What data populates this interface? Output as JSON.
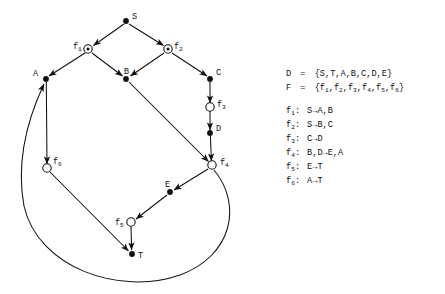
{
  "figure": {
    "kind": "petri-net-style-directed-graph",
    "ink_color": "#111111",
    "background": "#ffffff"
  },
  "graph": {
    "place_nodes": [
      {
        "id": "S",
        "label": "S",
        "x": 126,
        "y": 21,
        "label_dx": 6,
        "label_dy": -8
      },
      {
        "id": "A",
        "label": "A",
        "x": 46,
        "y": 79,
        "label_dx": -13,
        "label_dy": -9
      },
      {
        "id": "B",
        "label": "B",
        "x": 126,
        "y": 79,
        "label_dx": -2,
        "label_dy": -11
      },
      {
        "id": "C",
        "label": "C",
        "x": 210,
        "y": 79,
        "label_dx": 6,
        "label_dy": -10
      },
      {
        "id": "D",
        "label": "D",
        "x": 210,
        "y": 133,
        "label_dx": 6,
        "label_dy": -8
      },
      {
        "id": "E",
        "label": "E",
        "x": 170,
        "y": 192,
        "label_dx": -5,
        "label_dy": -11
      },
      {
        "id": "T",
        "label": "T",
        "x": 132,
        "y": 254,
        "label_dx": 6,
        "label_dy": -2
      }
    ],
    "transition_nodes": [
      {
        "id": "f1",
        "base": "f",
        "sub": "1",
        "x": 88,
        "y": 49,
        "label_dx": -15,
        "label_dy": -6
      },
      {
        "id": "f2",
        "base": "f",
        "sub": "2",
        "x": 168,
        "y": 49,
        "label_dx": 6,
        "label_dy": -6
      },
      {
        "id": "f3",
        "base": "f",
        "sub": "3",
        "x": 210,
        "y": 107,
        "label_dx": 7,
        "label_dy": -6
      },
      {
        "id": "f4",
        "base": "f",
        "sub": "4",
        "x": 212,
        "y": 165,
        "label_dx": 8,
        "label_dy": -6
      },
      {
        "id": "f5",
        "base": "f",
        "sub": "5",
        "x": 131,
        "y": 222,
        "label_dx": -16,
        "label_dy": -3
      },
      {
        "id": "f6",
        "base": "f",
        "sub": "6",
        "x": 47,
        "y": 168,
        "label_dx": 6,
        "label_dy": -10
      }
    ],
    "edges": [
      {
        "from": "S",
        "to": "f1",
        "shape": "line"
      },
      {
        "from": "S",
        "to": "f2",
        "shape": "line"
      },
      {
        "from": "f1",
        "to": "A",
        "shape": "line"
      },
      {
        "from": "f1",
        "to": "B",
        "shape": "line"
      },
      {
        "from": "f2",
        "to": "B",
        "shape": "line"
      },
      {
        "from": "f2",
        "to": "C",
        "shape": "line"
      },
      {
        "from": "C",
        "to": "f3",
        "shape": "line"
      },
      {
        "from": "f3",
        "to": "D",
        "shape": "line"
      },
      {
        "from": "D",
        "to": "f4",
        "shape": "line"
      },
      {
        "from": "B",
        "to": "f4",
        "shape": "line"
      },
      {
        "from": "f4",
        "to": "E",
        "shape": "line"
      },
      {
        "from": "E",
        "to": "f5",
        "shape": "line"
      },
      {
        "from": "f5",
        "to": "T",
        "shape": "line"
      },
      {
        "from": "A",
        "to": "f6",
        "shape": "line"
      },
      {
        "from": "f6",
        "to": "T",
        "shape": "line"
      },
      {
        "from": "f4",
        "to": "A",
        "shape": "curve"
      }
    ]
  },
  "legend": {
    "set_lines": [
      {
        "name": "D-set",
        "lhs": "D",
        "eq": "=",
        "rhs": "{S,T,A,B,C,D,E}"
      },
      {
        "name": "F-set",
        "lhs": "F",
        "eq": "=",
        "rhs_parts": [
          "{f",
          "1",
          ",f",
          "2",
          ",f",
          "3",
          ",f",
          "4",
          ",f",
          "5",
          ",f",
          "6",
          "}"
        ],
        "rhs_plain": "{f1,f2,f3,f4,f5,f6}"
      }
    ],
    "rules": [
      {
        "name": "f1",
        "base": "f",
        "sub": "1",
        "colon": ":",
        "body": "S→A,B"
      },
      {
        "name": "f2",
        "base": "f",
        "sub": "2",
        "colon": ":",
        "body": "S→B,C"
      },
      {
        "name": "f3",
        "base": "f",
        "sub": "3",
        "colon": ":",
        "body": "C→D"
      },
      {
        "name": "f4",
        "base": "f",
        "sub": "4",
        "colon": ":",
        "body": "B,D→E,A"
      },
      {
        "name": "f5",
        "base": "f",
        "sub": "5",
        "colon": ":",
        "body": "E→T"
      },
      {
        "name": "f6",
        "base": "f",
        "sub": "6",
        "colon": ":",
        "body": "A→T"
      }
    ]
  }
}
